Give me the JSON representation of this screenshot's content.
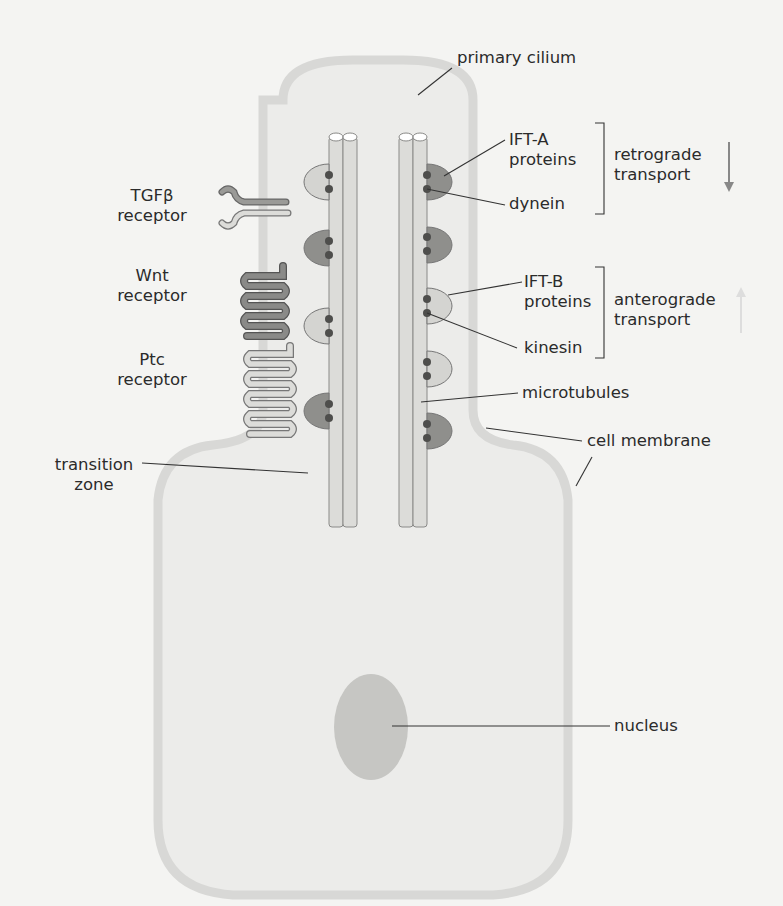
{
  "diagram": {
    "title_label": "primary cilium",
    "left_labels": {
      "tgfb": [
        "TGFβ",
        "receptor"
      ],
      "wnt": [
        "Wnt",
        "receptor"
      ],
      "ptc": [
        "Ptc",
        "receptor"
      ],
      "transition": [
        "transition",
        "zone"
      ]
    },
    "right_labels": {
      "ifta": [
        "IFT-A",
        "proteins"
      ],
      "dynein": "dynein",
      "retrograde": [
        "retrograde",
        "transport"
      ],
      "iftb": [
        "IFT-B",
        "proteins"
      ],
      "kinesin": "kinesin",
      "anterograde": [
        "anterograde",
        "transport"
      ],
      "microtubules": "microtubules",
      "cell_membrane": "cell membrane",
      "nucleus": "nucleus"
    },
    "colors": {
      "background": "#f4f4f2",
      "membrane": "#d8d8d6",
      "cell_fill": "#ececea",
      "light_protein": "#d4d4d1",
      "dark_protein": "#8f8f8c",
      "motor_dot": "#4e4e4c",
      "nucleus": "#c6c6c3"
    }
  }
}
